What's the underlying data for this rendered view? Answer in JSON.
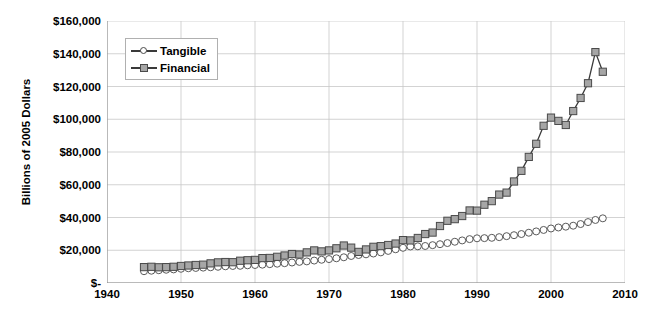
{
  "chart_data": {
    "type": "line",
    "title": "",
    "xlabel": "",
    "ylabel": "Billions of 2005 Dollars",
    "xlim": [
      1940,
      2010
    ],
    "ylim": [
      0,
      160000
    ],
    "xticks": [
      1940,
      1950,
      1960,
      1970,
      1980,
      1990,
      2000,
      2010
    ],
    "xtick_labels": [
      "1940",
      "1950",
      "1960",
      "1970",
      "1980",
      "1990",
      "2000",
      "2010"
    ],
    "yticks": [
      0,
      20000,
      40000,
      60000,
      80000,
      100000,
      120000,
      140000,
      160000
    ],
    "ytick_labels": [
      "$-",
      "$20,000",
      "$40,000",
      "$60,000",
      "$80,000",
      "$100,000",
      "$120,000",
      "$140,000",
      "$160,000"
    ],
    "grid": true,
    "legend_position": "upper-left-inside",
    "x": [
      1945,
      1946,
      1947,
      1948,
      1949,
      1950,
      1951,
      1952,
      1953,
      1954,
      1955,
      1956,
      1957,
      1958,
      1959,
      1960,
      1961,
      1962,
      1963,
      1964,
      1965,
      1966,
      1967,
      1968,
      1969,
      1970,
      1971,
      1972,
      1973,
      1974,
      1975,
      1976,
      1977,
      1978,
      1979,
      1980,
      1981,
      1982,
      1983,
      1984,
      1985,
      1986,
      1987,
      1988,
      1989,
      1990,
      1991,
      1992,
      1993,
      1994,
      1995,
      1996,
      1997,
      1998,
      1999,
      2000,
      2001,
      2002,
      2003,
      2004,
      2005,
      2006,
      2007
    ],
    "series": [
      {
        "name": "Tangible",
        "marker": "open-circle",
        "marker_color": "#ffffff",
        "line_color": "#4a4a4a",
        "values": [
          7200,
          7500,
          7800,
          8100,
          8300,
          8700,
          9000,
          9200,
          9400,
          9600,
          9900,
          10200,
          10400,
          10500,
          10800,
          11000,
          11200,
          11500,
          11800,
          12100,
          12500,
          12900,
          13200,
          13700,
          14200,
          14600,
          15100,
          15700,
          16500,
          17100,
          17500,
          18000,
          18700,
          19600,
          20600,
          21500,
          22300,
          22400,
          22600,
          23100,
          23700,
          24400,
          25200,
          26000,
          26800,
          27300,
          27400,
          27600,
          28000,
          28600,
          29200,
          29900,
          30700,
          31500,
          32400,
          33300,
          33900,
          34400,
          35000,
          36000,
          37200,
          38500,
          39500
        ]
      },
      {
        "name": "Financial",
        "marker": "filled-square",
        "marker_color": "#a6a6a6",
        "line_color": "#3a3a3a",
        "values": [
          9700,
          9900,
          9600,
          9700,
          9900,
          10400,
          10700,
          11000,
          11200,
          12000,
          12600,
          12800,
          12700,
          13600,
          13900,
          14100,
          15200,
          15300,
          16000,
          16800,
          17700,
          17400,
          18700,
          19900,
          19300,
          19900,
          21200,
          22900,
          21600,
          19000,
          20500,
          22100,
          22500,
          23200,
          24100,
          26200,
          26000,
          27500,
          29900,
          30800,
          34800,
          38000,
          39000,
          40900,
          44300,
          44200,
          47800,
          50000,
          54000,
          55200,
          62000,
          68500,
          77000,
          85000,
          96000,
          101000,
          99000,
          96500,
          105000,
          113000,
          122000,
          141000,
          129000
        ]
      }
    ],
    "annotations": {
      "financial_peak_year": 2006,
      "financial_peak_value": 141000,
      "financial_last_value": 129000,
      "tangible_last_value": 39500
    }
  },
  "legend": {
    "items": [
      {
        "label": "Tangible"
      },
      {
        "label": "Financial"
      }
    ]
  },
  "caption": {
    "text": ""
  }
}
